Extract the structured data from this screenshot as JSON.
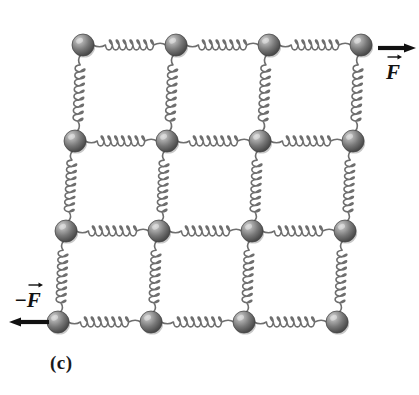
{
  "figure": {
    "panel_label": "(c)",
    "type": "physics-diagram",
    "background_color": "#ffffff"
  },
  "labels": {
    "force_top": "F",
    "force_bottom": "F",
    "force_bottom_sign": "−"
  },
  "arrows": [
    {
      "name": "force-arrow-top-right",
      "direction": "right",
      "x1": 378,
      "y1": 48,
      "x2": 416,
      "y2": 48,
      "color": "#111111"
    },
    {
      "name": "force-arrow-bottom-left",
      "direction": "left",
      "x1": 49,
      "y1": 322,
      "x2": 9,
      "y2": 322,
      "color": "#111111"
    }
  ],
  "lattice": {
    "rows": 4,
    "cols": 4,
    "node_radius": 11,
    "node_color_dark": "#4a4a4a",
    "node_color_mid": "#7d7d7d",
    "node_color_light": "#c9c9c9",
    "spring_color": "#6e6e6e",
    "row_shift_px": -8,
    "nodes": [
      [
        {
          "x": 83,
          "y": 45
        },
        {
          "x": 176,
          "y": 45
        },
        {
          "x": 269,
          "y": 45
        },
        {
          "x": 361,
          "y": 45
        }
      ],
      [
        {
          "x": 75,
          "y": 141
        },
        {
          "x": 167,
          "y": 141
        },
        {
          "x": 260,
          "y": 141
        },
        {
          "x": 353,
          "y": 141
        }
      ],
      [
        {
          "x": 66,
          "y": 231
        },
        {
          "x": 159,
          "y": 231
        },
        {
          "x": 252,
          "y": 231
        },
        {
          "x": 345,
          "y": 231
        }
      ],
      [
        {
          "x": 58,
          "y": 322
        },
        {
          "x": 151,
          "y": 322
        },
        {
          "x": 244,
          "y": 322
        },
        {
          "x": 337,
          "y": 322
        }
      ]
    ],
    "horizontal_spring_coils": 7,
    "vertical_spring_coils": 8
  },
  "colors": {
    "ink": "#111111",
    "spring": "#6e6e6e",
    "sphere_shadow": "#3a3a3a"
  }
}
